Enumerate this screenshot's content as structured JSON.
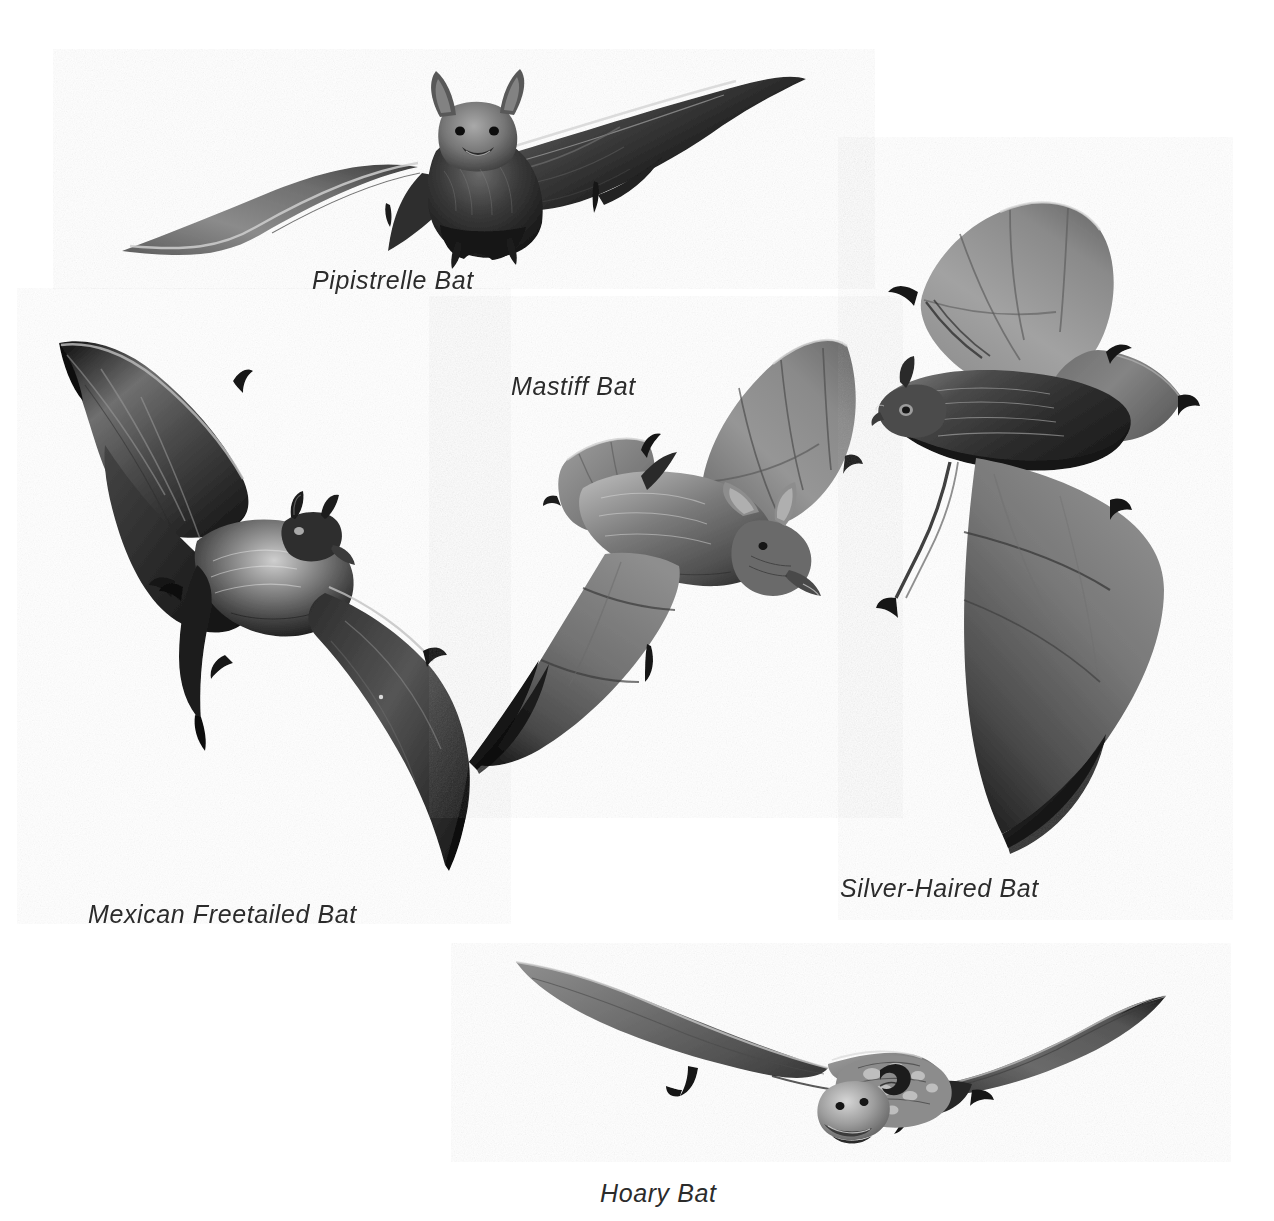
{
  "plate": {
    "kind": "natural-history-illustration-plate",
    "medium": "graphite pencil drawing",
    "background_color": "#ffffff",
    "label_color": "#2b2b2b",
    "label_style": "italic sans-serif",
    "subject": "bats in flight",
    "figure_count": 5
  },
  "figures": [
    {
      "id": "pipistrelle",
      "label": "Pipistrelle Bat",
      "pose": "frontal view, wings spread wide horizontally",
      "tone": "very dark body and right wing, pale grey left wing membrane",
      "label_position": "below-center-left"
    },
    {
      "id": "mastiff",
      "label": "Mastiff Bat",
      "pose": "diagonal side view, head lower-right, wings raised upper-right",
      "tone": "mid grey translucent wing membranes, darker furred body",
      "label_position": "upper-left of figure"
    },
    {
      "id": "mexican-freetailed",
      "label": "Mexican Freetailed Bat",
      "pose": "three-quarter view, left wing raised high, right wing sweeping down-right",
      "tone": "very dark charcoal wings with pale highlights on the body fur",
      "label_position": "below-left"
    },
    {
      "id": "silver-haired",
      "label": "Silver-Haired Bat",
      "pose": "left-facing profile, upper wing raised, lower wing sweeping down",
      "tone": "dark banded body, medium grey wings, frosted silver fur tips",
      "label_position": "below-right"
    },
    {
      "id": "hoary",
      "label": "Hoary Bat",
      "pose": "frontal view, long narrow wings swept back and out",
      "tone": "mottled frosted face and shoulders, dark grey wing membranes",
      "label_position": "below-center"
    }
  ]
}
